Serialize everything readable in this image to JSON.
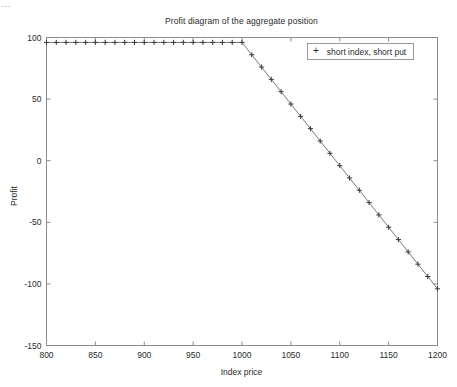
{
  "figure": {
    "title": "Profit diagram of the aggregate position",
    "background_color": "#ffffff",
    "axis_color": "#8c8c8c",
    "series_color": "#3a3a3a",
    "corner_artifact": "..."
  },
  "legend": {
    "position": "top-right",
    "marker": "+",
    "entries": [
      {
        "label": "short index, short put",
        "marker": "+"
      }
    ]
  },
  "axes": {
    "x": {
      "label": "Index price",
      "ticks": [
        "800",
        "850",
        "900",
        "950",
        "1000",
        "1050",
        "1100",
        "1150",
        "1200"
      ],
      "min": 800,
      "max": 1200
    },
    "y": {
      "label": "Profit",
      "ticks": [
        "100",
        "50",
        "0",
        "-50",
        "-100",
        "-150"
      ],
      "min": -150,
      "max": 100
    }
  },
  "chart_data": {
    "type": "line",
    "title": "Profit diagram of the aggregate position",
    "xlabel": "Index price",
    "ylabel": "Profit",
    "xlim": [
      800,
      1200
    ],
    "ylim": [
      -150,
      100
    ],
    "grid": false,
    "legend_position": "upper right",
    "marker": "+",
    "line_style": "solid",
    "xticks": [
      800,
      850,
      900,
      950,
      1000,
      1050,
      1100,
      1150,
      1200
    ],
    "yticks": [
      100,
      50,
      0,
      -50,
      -100,
      -150
    ],
    "annotations": [
      {
        "text": "breakpoint at put strike",
        "x": 1000,
        "y": 96
      },
      {
        "text": "break-even",
        "x": 1096,
        "y": 0
      }
    ],
    "series": [
      {
        "name": "short index, short put",
        "x": [
          800,
          810,
          820,
          830,
          840,
          850,
          860,
          870,
          880,
          890,
          900,
          910,
          920,
          930,
          940,
          950,
          960,
          970,
          980,
          990,
          1000,
          1010,
          1020,
          1030,
          1040,
          1050,
          1060,
          1070,
          1080,
          1090,
          1100,
          1110,
          1120,
          1130,
          1140,
          1150,
          1160,
          1170,
          1180,
          1190,
          1200
        ],
        "values": [
          96,
          96,
          96,
          96,
          96,
          96,
          96,
          96,
          96,
          96,
          96,
          96,
          96,
          96,
          96,
          96,
          96,
          96,
          96,
          96,
          96,
          86,
          76,
          66,
          56,
          46,
          36,
          26,
          16,
          6,
          -4,
          -14,
          -24,
          -34,
          -44,
          -54,
          -64,
          -74,
          -84,
          -94,
          -104
        ]
      }
    ]
  }
}
